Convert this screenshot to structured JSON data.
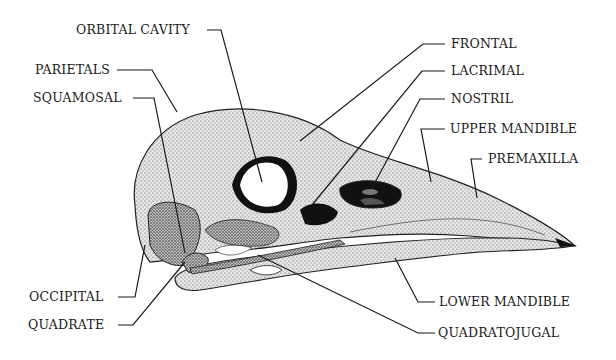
{
  "figure": {
    "colors": {
      "ink": "#1a1a1a",
      "bone": "#d9d9d9",
      "cavity": "#111111",
      "background": "#ffffff"
    }
  },
  "labels": {
    "orbital_cavity": "ORBITAL CAVITY",
    "parietals": "PARIETALS",
    "squamosal": "SQUAMOSAL",
    "occipital": "OCCIPITAL",
    "quadrate": "QUADRATE",
    "frontal": "FRONTAL",
    "lacrimal": "LACRIMAL",
    "nostril": "NOSTRIL",
    "upper_mandible": "UPPER MANDIBLE",
    "premaxilla": "PREMAXILLA",
    "lower_mandible": "LOWER MANDIBLE",
    "quadratojugal": "QUADRATOJUGAL"
  }
}
